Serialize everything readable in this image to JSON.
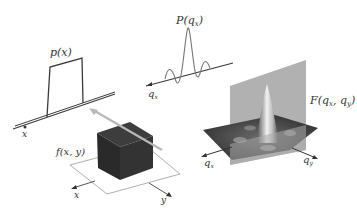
{
  "diagram": {
    "profile_1d": {
      "label": "p(x)",
      "axis_label": "x"
    },
    "fourier_1d": {
      "label": "P(q",
      "label_sub": "x",
      "label_close": ")",
      "axis_label": "q",
      "axis_sub": "x"
    },
    "object_2d": {
      "label": "f(x, y)",
      "axis_x": "x",
      "axis_y": "y"
    },
    "fourier_2d": {
      "label": "F(q",
      "label_sub1": "x",
      "label_mid": ", q",
      "label_sub2": "y",
      "label_close": ")",
      "axis_qx": "q",
      "axis_qx_sub": "x",
      "axis_qy": "q",
      "axis_qy_sub": "y"
    },
    "colors": {
      "line": "#3a3a3a",
      "cube_dark": "#2b2b2b",
      "slice_plane": "#a9a9a9",
      "arrow_gray": "#b0b0b0",
      "surface_dark": "#3c3c3c",
      "peak_light": "#e6e6e6"
    }
  }
}
